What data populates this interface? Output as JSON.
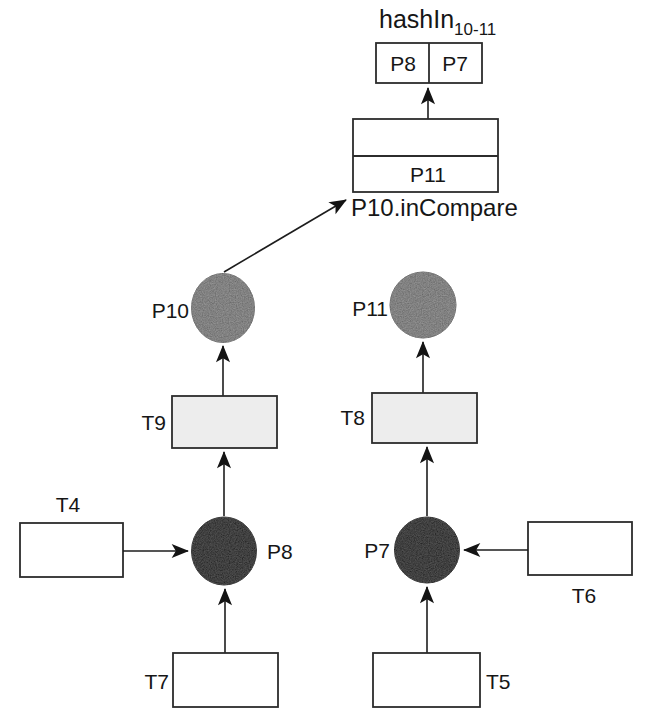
{
  "figure": {
    "title": {
      "base": "hashIn",
      "sub": "10-11"
    },
    "hash_table": {
      "cells": [
        "P8",
        "P7"
      ]
    },
    "queue": {
      "entry": "P11",
      "caption": "P10.inCompare"
    },
    "places": {
      "p10": {
        "label": "P10"
      },
      "p11": {
        "label": "P11"
      },
      "p8": {
        "label": "P8"
      },
      "p7": {
        "label": "P7"
      }
    },
    "transitions": {
      "t9": {
        "label": "T9"
      },
      "t8": {
        "label": "T8"
      },
      "t4": {
        "label": "T4"
      },
      "t6": {
        "label": "T6"
      },
      "t7": {
        "label": "T7"
      },
      "t5": {
        "label": "T5"
      }
    },
    "colors": {
      "place_gray": "#616161",
      "place_dark": "#191919",
      "transition_fill": "#ededed",
      "transition_empty": "#ffffff",
      "box_fill": "#ffffff",
      "line": "#1d1d1d",
      "background": "#ffffff"
    }
  }
}
